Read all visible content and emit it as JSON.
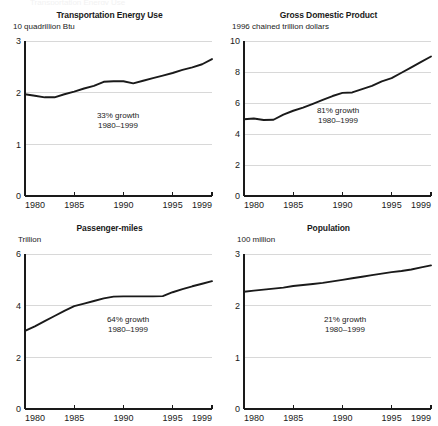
{
  "figure": {
    "panel_count": 4,
    "top_artifact_text": "Transportation Energy Use"
  },
  "chart_data": [
    {
      "type": "line",
      "title": "Transportation Energy Use",
      "units_label": "10 quadrillion Btu",
      "xlabel": "",
      "ylabel": "10 quadrillion Btu",
      "grid": true,
      "legend": "none",
      "xlim": [
        1980,
        1999
      ],
      "ylim": [
        0,
        3
      ],
      "yticks": [
        0,
        1,
        2,
        3
      ],
      "ytick_labels": [
        "0",
        "1",
        "2",
        "3"
      ],
      "xticks": [
        1980,
        1985,
        1990,
        1995,
        1999
      ],
      "xtick_labels": [
        "1980",
        "1985",
        "1990",
        "1995",
        "1999"
      ],
      "annotation_lines": [
        "33% growth",
        "1980–1999"
      ],
      "x": [
        1980,
        1981,
        1982,
        1983,
        1984,
        1985,
        1986,
        1987,
        1988,
        1989,
        1990,
        1991,
        1992,
        1993,
        1994,
        1995,
        1996,
        1997,
        1998,
        1999
      ],
      "values": [
        1.97,
        1.94,
        1.91,
        1.91,
        1.97,
        2.02,
        2.08,
        2.13,
        2.21,
        2.22,
        2.22,
        2.18,
        2.23,
        2.28,
        2.33,
        2.38,
        2.44,
        2.49,
        2.55,
        2.65
      ]
    },
    {
      "type": "line",
      "title": "Gross Domestic Product",
      "units_label": "1996 chained trillion dollars",
      "xlabel": "",
      "ylabel": "1996 chained trillion dollars",
      "grid": true,
      "legend": "none",
      "xlim": [
        1980,
        1999
      ],
      "ylim": [
        0,
        10
      ],
      "yticks": [
        0,
        2,
        4,
        6,
        8,
        10
      ],
      "ytick_labels": [
        "0",
        "2",
        "4",
        "6",
        "8",
        "10"
      ],
      "xticks": [
        1980,
        1985,
        1990,
        1995,
        1999
      ],
      "xtick_labels": [
        "1980",
        "1985",
        "1990",
        "1995",
        "1999"
      ],
      "annotation_lines": [
        "81% growth",
        "1980–1999"
      ],
      "x": [
        1980,
        1981,
        1982,
        1983,
        1984,
        1985,
        1986,
        1987,
        1988,
        1989,
        1990,
        1991,
        1992,
        1993,
        1994,
        1995,
        1996,
        1997,
        1998,
        1999
      ],
      "values": [
        4.95,
        5.0,
        4.9,
        4.92,
        5.25,
        5.5,
        5.7,
        5.95,
        6.2,
        6.45,
        6.65,
        6.68,
        6.9,
        7.1,
        7.4,
        7.6,
        7.95,
        8.3,
        8.65,
        9.0
      ]
    },
    {
      "type": "line",
      "title": "Passenger-miles",
      "units_label": "Trillion",
      "xlabel": "",
      "ylabel": "Trillion",
      "grid": true,
      "legend": "none",
      "xlim": [
        1980,
        1999
      ],
      "ylim": [
        0,
        6
      ],
      "yticks": [
        0,
        2,
        4,
        6
      ],
      "ytick_labels": [
        "0",
        "2",
        "4",
        "6"
      ],
      "xticks": [
        1980,
        1985,
        1990,
        1995,
        1999
      ],
      "xtick_labels": [
        "1980",
        "1985",
        "1990",
        "1995",
        "1999"
      ],
      "annotation_lines": [
        "64% growth",
        "1980–1999"
      ],
      "x": [
        1980,
        1981,
        1982,
        1983,
        1984,
        1985,
        1986,
        1987,
        1988,
        1989,
        1990,
        1991,
        1992,
        1993,
        1994,
        1995,
        1996,
        1997,
        1998,
        1999
      ],
      "values": [
        3.02,
        3.2,
        3.4,
        3.6,
        3.8,
        3.98,
        4.08,
        4.18,
        4.28,
        4.35,
        4.36,
        4.36,
        4.36,
        4.36,
        4.37,
        4.52,
        4.64,
        4.75,
        4.85,
        4.95
      ]
    },
    {
      "type": "line",
      "title": "Population",
      "units_label": "100 million",
      "xlabel": "",
      "ylabel": "100 million",
      "grid": true,
      "legend": "none",
      "xlim": [
        1980,
        1999
      ],
      "ylim": [
        0,
        3
      ],
      "yticks": [
        0,
        1,
        2,
        3
      ],
      "ytick_labels": [
        "0",
        "1",
        "2",
        "3"
      ],
      "xticks": [
        1980,
        1985,
        1990,
        1995,
        1999
      ],
      "xtick_labels": [
        "1980",
        "1985",
        "1990",
        "1995",
        "1999"
      ],
      "annotation_lines": [
        "21% growth",
        "1980–1999"
      ],
      "x": [
        1980,
        1981,
        1982,
        1983,
        1984,
        1985,
        1986,
        1987,
        1988,
        1989,
        1990,
        1991,
        1992,
        1993,
        1994,
        1995,
        1996,
        1997,
        1998,
        1999
      ],
      "values": [
        2.27,
        2.29,
        2.31,
        2.33,
        2.35,
        2.38,
        2.4,
        2.42,
        2.44,
        2.47,
        2.5,
        2.53,
        2.56,
        2.59,
        2.62,
        2.65,
        2.67,
        2.7,
        2.74,
        2.78
      ]
    }
  ]
}
